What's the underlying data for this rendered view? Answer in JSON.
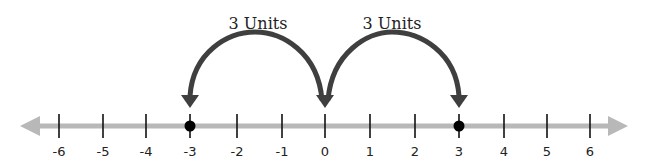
{
  "colors": {
    "axis": "#b8b8b8",
    "tick": "#111111",
    "point": "#000000",
    "arc": "#3f3f3f",
    "text": "#222222"
  },
  "number_line": {
    "min": -6,
    "max": 6,
    "ticks": [
      {
        "value": -6,
        "label": "-6",
        "x": 59
      },
      {
        "value": -5,
        "label": "-5",
        "x": 103
      },
      {
        "value": -4,
        "label": "-4",
        "x": 146
      },
      {
        "value": -3,
        "label": "-3",
        "x": 190
      },
      {
        "value": -2,
        "label": "-2",
        "x": 237
      },
      {
        "value": -1,
        "label": "-1",
        "x": 282
      },
      {
        "value": 0,
        "label": "0",
        "x": 325
      },
      {
        "value": 1,
        "label": "1",
        "x": 370
      },
      {
        "value": 2,
        "label": "2",
        "x": 415
      },
      {
        "value": 3,
        "label": "3",
        "x": 459
      },
      {
        "value": 4,
        "label": "4",
        "x": 504
      },
      {
        "value": 5,
        "label": "5",
        "x": 547
      },
      {
        "value": 6,
        "label": "6",
        "x": 590
      }
    ],
    "points": [
      {
        "value": -3,
        "x": 190
      },
      {
        "value": 3,
        "x": 459
      }
    ]
  },
  "jumps": [
    {
      "from": 0,
      "to": -3,
      "label": "3 Units"
    },
    {
      "from": 0,
      "to": 3,
      "label": "3 Units"
    }
  ]
}
